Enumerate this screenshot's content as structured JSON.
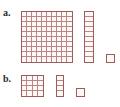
{
  "figure": {
    "type": "base-ten-blocks-illustration",
    "background_color": "#ffffff",
    "line_color": "#9d5c5c",
    "inner_line_color": "#b98585",
    "fill_color": "#fdf7f6",
    "rows": [
      {
        "id": "a",
        "label": "a.",
        "blocks": [
          {
            "name": "hundreds-flat",
            "columns": 10,
            "rows": 10,
            "unit_count": 100,
            "place_value": "hundreds"
          },
          {
            "name": "tens-rod",
            "columns": 1,
            "rows": 10,
            "unit_count": 10,
            "place_value": "tens"
          },
          {
            "name": "ones-unit",
            "columns": 1,
            "rows": 1,
            "unit_count": 1,
            "place_value": "ones"
          }
        ]
      },
      {
        "id": "b",
        "label": "b.",
        "blocks": [
          {
            "name": "square-flat",
            "columns": 4,
            "rows": 4,
            "unit_count": 16,
            "place_value": "hundreds"
          },
          {
            "name": "short-rod",
            "columns": 1,
            "rows": 4,
            "unit_count": 4,
            "place_value": "tens"
          },
          {
            "name": "ones-unit",
            "columns": 1,
            "rows": 1,
            "unit_count": 1,
            "place_value": "ones"
          }
        ]
      }
    ]
  }
}
